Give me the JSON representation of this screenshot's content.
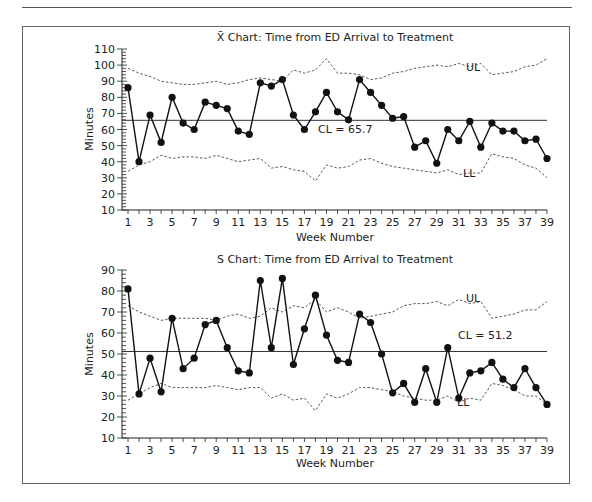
{
  "chart_data": [
    {
      "type": "line",
      "title": "X̄ Chart: Time from ED Arrival to Treatment",
      "xlabel": "Week Number",
      "ylabel": "Minutes",
      "ylim": [
        10,
        110
      ],
      "yticks": [
        10,
        20,
        30,
        40,
        50,
        60,
        70,
        80,
        90,
        100,
        110
      ],
      "xticks": [
        1,
        3,
        5,
        7,
        9,
        11,
        13,
        15,
        17,
        19,
        21,
        23,
        25,
        27,
        29,
        31,
        33,
        35,
        37,
        39
      ],
      "x": [
        1,
        2,
        3,
        4,
        5,
        6,
        7,
        8,
        9,
        10,
        11,
        12,
        13,
        14,
        15,
        16,
        17,
        18,
        19,
        20,
        21,
        22,
        23,
        24,
        25,
        26,
        27,
        28,
        29,
        30,
        31,
        32,
        33,
        34,
        35,
        36,
        37,
        38,
        39
      ],
      "series": [
        {
          "name": "X-bar",
          "values": [
            86,
            40,
            69,
            52,
            80,
            64,
            60,
            77,
            75,
            73,
            59,
            57,
            89,
            87,
            91,
            69,
            60,
            71,
            83,
            71,
            66,
            91,
            83,
            75,
            67,
            68,
            49,
            53,
            39,
            60,
            53,
            65,
            49,
            64,
            59,
            59,
            53,
            54,
            42
          ]
        },
        {
          "name": "UL",
          "values": [
            98,
            95,
            93,
            90,
            89,
            88,
            88,
            89,
            90,
            88,
            89,
            91,
            92,
            91,
            90,
            97,
            95,
            97,
            104,
            95,
            95,
            94,
            91,
            92,
            95,
            96,
            98,
            99,
            100,
            99,
            101,
            99,
            101,
            94,
            95,
            96,
            99,
            100,
            104
          ]
        },
        {
          "name": "LL",
          "values": [
            34,
            38,
            40,
            44,
            42,
            43,
            43,
            42,
            44,
            42,
            40,
            41,
            42,
            36,
            37,
            35,
            34,
            28,
            38,
            36,
            37,
            41,
            42,
            39,
            37,
            36,
            35,
            34,
            33,
            35,
            32,
            33,
            33,
            45,
            43,
            42,
            38,
            36,
            30
          ]
        }
      ],
      "center_line": {
        "label": "CL = 65.7",
        "value": 65.7
      },
      "annotations": [
        "UL",
        "LL",
        "CL = 65.7"
      ],
      "grid": false
    },
    {
      "type": "line",
      "title": "S Chart: Time from ED Arrival to Treatment",
      "xlabel": "Week Number",
      "ylabel": "Minutes",
      "ylim": [
        10,
        90
      ],
      "yticks": [
        10,
        20,
        30,
        40,
        50,
        60,
        70,
        80,
        90
      ],
      "xticks": [
        1,
        3,
        5,
        7,
        9,
        11,
        13,
        15,
        17,
        19,
        21,
        23,
        25,
        27,
        29,
        31,
        33,
        35,
        37,
        39
      ],
      "x": [
        1,
        2,
        3,
        4,
        5,
        6,
        7,
        8,
        9,
        10,
        11,
        12,
        13,
        14,
        15,
        16,
        17,
        18,
        19,
        20,
        21,
        22,
        23,
        24,
        25,
        26,
        27,
        28,
        29,
        30,
        31,
        32,
        33,
        34,
        35,
        36,
        37,
        38,
        39
      ],
      "series": [
        {
          "name": "S",
          "values": [
            81,
            31,
            48,
            32,
            67,
            43,
            48,
            64,
            66,
            53,
            42,
            41,
            85,
            53,
            86,
            45,
            62,
            78,
            59,
            47,
            46,
            69,
            65,
            50,
            31.5,
            36,
            27,
            43,
            27,
            53,
            29,
            41,
            42,
            46,
            38,
            34,
            43,
            34,
            26
          ]
        },
        {
          "name": "UL",
          "values": [
            73,
            70,
            68,
            66,
            67,
            67,
            67,
            67,
            66,
            68,
            69,
            67,
            68,
            72,
            70,
            73,
            72,
            76,
            70,
            72,
            70,
            67,
            68,
            69,
            70,
            73,
            74,
            74,
            75,
            73,
            76,
            74,
            75,
            67,
            68,
            69,
            71,
            71,
            75
          ]
        },
        {
          "name": "LL",
          "values": [
            28,
            31,
            34,
            36,
            34,
            34,
            34,
            34,
            35,
            34,
            33,
            34,
            34,
            29,
            31,
            28,
            29,
            23,
            31,
            29,
            31,
            34,
            34,
            33,
            32,
            30,
            29,
            28,
            28,
            30,
            27,
            29,
            28,
            36,
            35,
            33,
            30,
            30,
            26
          ]
        }
      ],
      "center_line": {
        "label": "CL = 51.2",
        "value": 51.2
      },
      "annotations": [
        "UL",
        "LL",
        "CL = 51.2"
      ],
      "grid": false
    }
  ],
  "labels": {
    "xbar_title": "X̄ Chart: Time from ED Arrival to Treatment",
    "s_title": "S Chart: Time from ED Arrival to Treatment",
    "xlabel": "Week Number",
    "ylabel": "Minutes",
    "ul": "UL",
    "ll": "LL",
    "xbar_cl": "CL = 65.7",
    "s_cl": "CL = 51.2"
  }
}
